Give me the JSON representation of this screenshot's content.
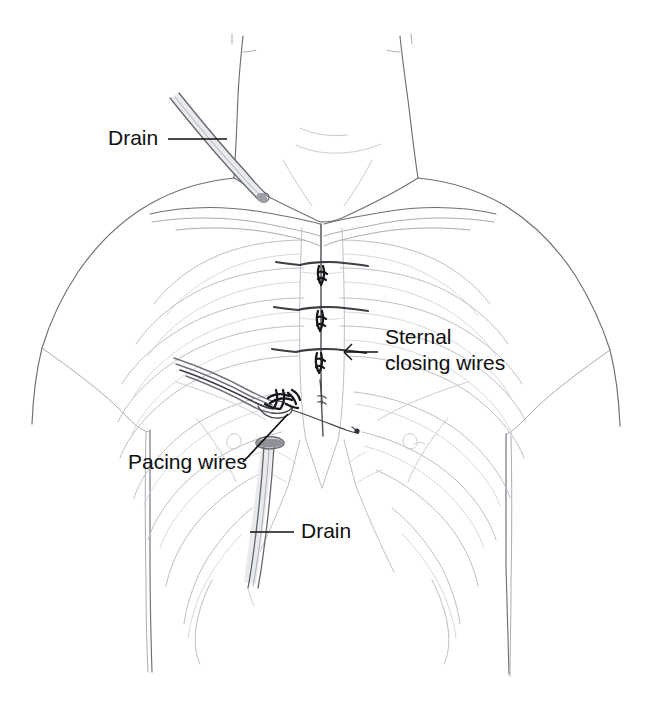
{
  "illustration": {
    "title": "Chest after open-heart surgery: sternal closing wires, pacing wires and drains",
    "subject": "human upper torso, anterior view, showing rib cage, sternum, clavicles",
    "background_color": "#ffffff",
    "line_color": "#6e7076",
    "bone_color": "#9fa3a9",
    "wire_color": "#3c3f44",
    "label_color": "#101010"
  },
  "labels": [
    {
      "id": "drain-upper",
      "text": "Drain",
      "x": 108,
      "y": 145,
      "anchor": "start",
      "leader": "horizontal line from text to upper chest drain tube"
    },
    {
      "id": "sternal-closing-wires",
      "text_line1": "Sternal",
      "text_line2": "closing wires",
      "x": 385,
      "y": 344,
      "anchor": "start",
      "leader": "horizontal line from text left to third sternal wire"
    },
    {
      "id": "pacing-wires",
      "text": "Pacing wires",
      "x": 128,
      "y": 469,
      "anchor": "start",
      "leader": "diagonal line from text up-right to pacing wire knot"
    },
    {
      "id": "drain-lower",
      "text": "Drain",
      "x": 301,
      "y": 538,
      "anchor": "start",
      "leader": "horizontal line from text left to lower chest drain tube"
    }
  ],
  "annotated_parts": [
    {
      "name": "upper-drain-tube",
      "description": "drain tube entering skin above left clavicle"
    },
    {
      "name": "lower-drain-tube",
      "description": "drain tube below sternum running down-left"
    },
    {
      "name": "sternal-wire-1",
      "description": "uppermost horizontal sternal closing wire"
    },
    {
      "name": "sternal-wire-2",
      "description": "middle horizontal sternal closing wire"
    },
    {
      "name": "sternal-wire-3",
      "description": "lower horizontal sternal closing wire"
    },
    {
      "name": "pacing-wire-bundle",
      "description": "bundle of thin pacing wires exiting skin with twisted knot"
    },
    {
      "name": "sternal-incision",
      "description": "vertical midline sternotomy incision line"
    },
    {
      "name": "rib-cage",
      "description": "ribs visible through skin on both sides"
    },
    {
      "name": "clavicles",
      "description": "collarbones curving from shoulders to sternal notch"
    },
    {
      "name": "xiphoid-process",
      "description": "lower tip of sternum"
    }
  ]
}
